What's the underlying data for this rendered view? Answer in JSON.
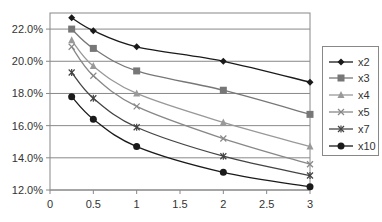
{
  "chart_data": {
    "type": "line",
    "title": "",
    "xlabel": "",
    "ylabel": "",
    "x": [
      0.25,
      0.5,
      1,
      2,
      3
    ],
    "xlim": [
      0,
      3
    ],
    "ylim": [
      12.0,
      23.0
    ],
    "x_ticks": [
      "0",
      "0.5",
      "1",
      "1.5",
      "2",
      "2.5",
      "3"
    ],
    "y_ticks": [
      "12.0%",
      "14.0%",
      "16.0%",
      "18.0%",
      "20.0%",
      "22.0%"
    ],
    "grid": "horizontal",
    "legend_position": "right",
    "series": [
      {
        "name": "x2",
        "marker": "diamond",
        "color": "#1a1a1a",
        "values": [
          22.7,
          21.9,
          20.9,
          20.0,
          18.7
        ]
      },
      {
        "name": "x3",
        "marker": "square",
        "color": "#777777",
        "values": [
          22.0,
          20.8,
          19.4,
          18.2,
          16.7
        ]
      },
      {
        "name": "x4",
        "marker": "triangle",
        "color": "#999999",
        "values": [
          21.3,
          19.7,
          18.0,
          16.2,
          14.7
        ]
      },
      {
        "name": "x5",
        "marker": "x",
        "color": "#888888",
        "values": [
          20.9,
          19.1,
          17.2,
          15.2,
          13.6
        ]
      },
      {
        "name": "x7",
        "marker": "star",
        "color": "#444444",
        "values": [
          19.3,
          17.7,
          15.9,
          14.1,
          12.9
        ]
      },
      {
        "name": "x10",
        "marker": "circle",
        "color": "#1a1a1a",
        "values": [
          17.8,
          16.4,
          14.7,
          13.1,
          12.2
        ]
      }
    ]
  },
  "legend": {
    "items": [
      {
        "label": "x2"
      },
      {
        "label": "x3"
      },
      {
        "label": "x4"
      },
      {
        "label": "x5"
      },
      {
        "label": "x7"
      },
      {
        "label": "x10"
      }
    ]
  }
}
